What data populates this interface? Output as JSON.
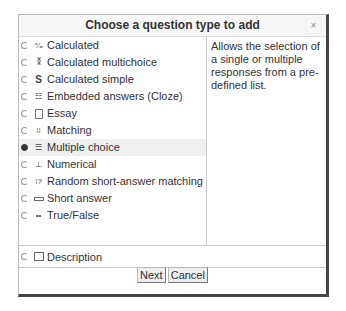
{
  "dialog": {
    "title": "Choose a question type to add",
    "close_label": "×",
    "description": "Allows the selection of a single or multiple responses from a pre-defined list.",
    "options": [
      {
        "label": "Calculated",
        "icon": "calculated-icon",
        "selected": false
      },
      {
        "label": "Calculated multichoice",
        "icon": "calculated-multichoice-icon",
        "selected": false
      },
      {
        "label": "Calculated simple",
        "icon": "calculated-simple-icon",
        "selected": false
      },
      {
        "label": "Embedded answers (Cloze)",
        "icon": "cloze-icon",
        "selected": false
      },
      {
        "label": "Essay",
        "icon": "essay-icon",
        "selected": false
      },
      {
        "label": "Matching",
        "icon": "matching-icon",
        "selected": false
      },
      {
        "label": "Multiple choice",
        "icon": "multichoice-icon",
        "selected": true
      },
      {
        "label": "Numerical",
        "icon": "numerical-icon",
        "selected": false
      },
      {
        "label": "Random short-answer matching",
        "icon": "random-matching-icon",
        "selected": false
      },
      {
        "label": "Short answer",
        "icon": "short-answer-icon",
        "selected": false
      },
      {
        "label": "True/False",
        "icon": "true-false-icon",
        "selected": false
      }
    ],
    "other": {
      "label": "Description",
      "icon": "description-icon",
      "selected": false
    },
    "buttons": {
      "next": "Next",
      "cancel": "Cancel"
    }
  }
}
